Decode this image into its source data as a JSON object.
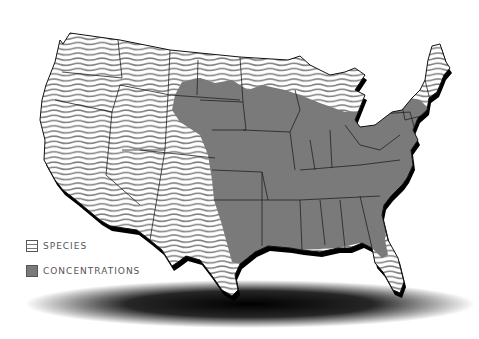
{
  "map": {
    "region": "Contiguous United States",
    "colors": {
      "background": "#ffffff",
      "concentration_fill": "#7a7a7a",
      "species_stripe": "#808080",
      "state_border": "#222222",
      "shadow": "#000000"
    }
  },
  "legend": {
    "items": [
      {
        "key": "species",
        "label": "SPECIES",
        "pattern": "wavy-stripes"
      },
      {
        "key": "concentrations",
        "label": "CONCENTRATIONS",
        "pattern": "solid-gray"
      }
    ]
  }
}
